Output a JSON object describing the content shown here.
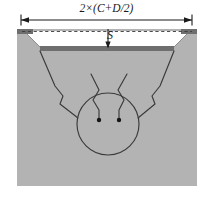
{
  "figure": {
    "labels": {
      "width_dimension": "2×(C+D/2)",
      "depth_dimension": "S"
    },
    "colors": {
      "soil_fill": "#b3b3b3",
      "ledge_dark": "#6e6e6e",
      "void_fill": "#ffffff",
      "line": "#2b2b2b",
      "background": "#ffffff"
    },
    "geometry": {
      "body": {
        "x": 17,
        "y": 29,
        "width": 180,
        "height": 157
      },
      "void_top_left": 24,
      "void_top_right": 190,
      "void_bottom_left": 40,
      "void_bottom_right": 174,
      "void_top_y": 31,
      "void_bottom_y": 46,
      "ledge_left": {
        "x": 17,
        "y": 29,
        "width": 16,
        "height": 5
      },
      "ledge_right": {
        "x": 181,
        "y": 29,
        "width": 16,
        "height": 5
      },
      "floor_bar": {
        "x": 40,
        "y": 46,
        "width": 134,
        "height": 5
      },
      "dim_line_y": 20,
      "dim_line_x1": 21,
      "dim_line_x2": 192,
      "depth_arrow_x": 108,
      "depth_arrow_y1": 31,
      "depth_arrow_y2": 47,
      "cavity_circle": {
        "cx": 108,
        "cy": 124,
        "r": 31
      },
      "dot_left": {
        "cx": 99,
        "cy": 120,
        "r": 2
      },
      "dot_right": {
        "cx": 119,
        "cy": 120,
        "r": 2
      }
    }
  }
}
